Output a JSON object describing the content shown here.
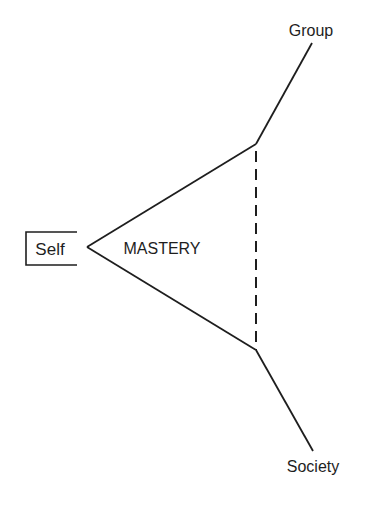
{
  "diagram": {
    "center_label": "MASTERY",
    "self_label": "Self",
    "group_label": "Group",
    "society_label": "Society",
    "colors": {
      "background": "#ffffff",
      "stroke": "#1e1e1e",
      "text": "#1e1e1e"
    },
    "edges": [
      {
        "from": "Self",
        "to": "top-vertex",
        "style": "solid"
      },
      {
        "from": "Self",
        "to": "bottom-vertex",
        "style": "solid"
      },
      {
        "from": "top-vertex",
        "to": "bottom-vertex",
        "style": "dashed"
      },
      {
        "from": "top-vertex",
        "to": "Group",
        "style": "solid"
      },
      {
        "from": "bottom-vertex",
        "to": "Society",
        "style": "solid"
      }
    ]
  }
}
